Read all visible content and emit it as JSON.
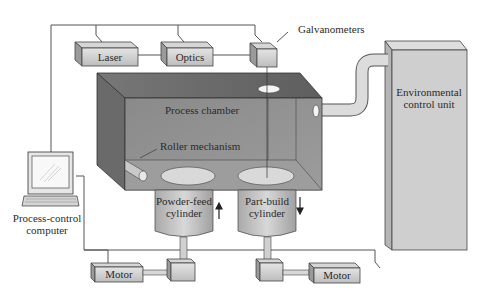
{
  "diagram": {
    "components": {
      "laser": "Laser",
      "optics": "Optics",
      "galvanometers": "Galvanometers",
      "process_chamber": "Process chamber",
      "roller_mechanism": "Roller mechanism",
      "powder_feed_line1": "Powder-feed",
      "powder_feed_line2": "cylinder",
      "part_build_line1": "Part-build",
      "part_build_line2": "cylinder",
      "env_line1": "Environmental",
      "env_line2": "control unit",
      "computer_line1": "Process-control",
      "computer_line2": "computer",
      "motor_left": "Motor",
      "motor_right": "Motor"
    },
    "arrows": {
      "powder_feed_direction": "up",
      "part_build_direction": "down"
    },
    "colors": {
      "chamber_front": "#8c8c8c",
      "chamber_top": "#6e6e6e",
      "box_light": "#d9d9d9",
      "lines": "#555555"
    }
  }
}
